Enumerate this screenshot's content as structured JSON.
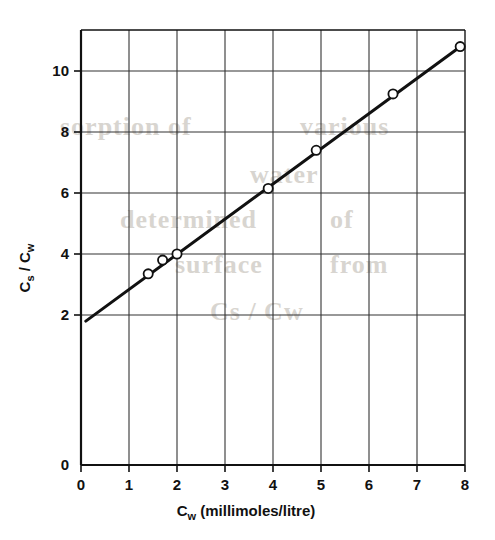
{
  "figure": {
    "background_bleed": [
      {
        "text": "sorption of",
        "x": 60,
        "y": 112,
        "size": 26
      },
      {
        "text": "various",
        "x": 300,
        "y": 112,
        "size": 26
      },
      {
        "text": "water",
        "x": 250,
        "y": 160,
        "size": 26
      },
      {
        "text": "determined",
        "x": 120,
        "y": 205,
        "size": 26
      },
      {
        "text": "of",
        "x": 330,
        "y": 205,
        "size": 26
      },
      {
        "text": "surface",
        "x": 175,
        "y": 250,
        "size": 26
      },
      {
        "text": "from",
        "x": 330,
        "y": 250,
        "size": 26
      },
      {
        "text": "Cs / Cw",
        "x": 210,
        "y": 297,
        "size": 26
      }
    ]
  },
  "chart_data": {
    "type": "scatter",
    "title": "",
    "xlabel": "C_w (millimoles/litre)",
    "xlabel_main": "C",
    "xlabel_sub": "w",
    "xlabel_rest": " (millimoles/litre)",
    "ylabel": "C_s / C_w",
    "ylabel_num": "C",
    "ylabel_num_sub": "s",
    "ylabel_sep": " / ",
    "ylabel_den": "C",
    "ylabel_den_sub": "w",
    "xlim": [
      0,
      8
    ],
    "ylim": [
      0,
      11.3
    ],
    "xticks": [
      0,
      1,
      2,
      3,
      4,
      5,
      6,
      7,
      8
    ],
    "xtick_labels": [
      "0",
      "1",
      "2",
      "3",
      "4",
      "5",
      "6",
      "7",
      "8"
    ],
    "yticks": [
      2,
      4,
      6,
      8,
      10
    ],
    "ytick_labels": [
      "2",
      "4",
      "6",
      "8",
      "10"
    ],
    "grid": true,
    "legend": "none",
    "marker": "open-circle",
    "points": [
      {
        "x": 1.4,
        "y": 3.35
      },
      {
        "x": 1.7,
        "y": 3.8
      },
      {
        "x": 2.0,
        "y": 4.0
      },
      {
        "x": 3.9,
        "y": 6.15
      },
      {
        "x": 4.9,
        "y": 7.4
      },
      {
        "x": 6.5,
        "y": 9.25
      },
      {
        "x": 7.9,
        "y": 10.8
      }
    ],
    "fit_line": {
      "x_start": 0.1,
      "y_start": 1.8,
      "x_end": 7.95,
      "y_end": 10.85,
      "slope": 1.153,
      "intercept": 1.685
    },
    "colors": {
      "line": "#111111",
      "grid": "#333333",
      "axis": "#111111",
      "marker_fill": "#ffffff",
      "background": "#ffffff"
    }
  }
}
